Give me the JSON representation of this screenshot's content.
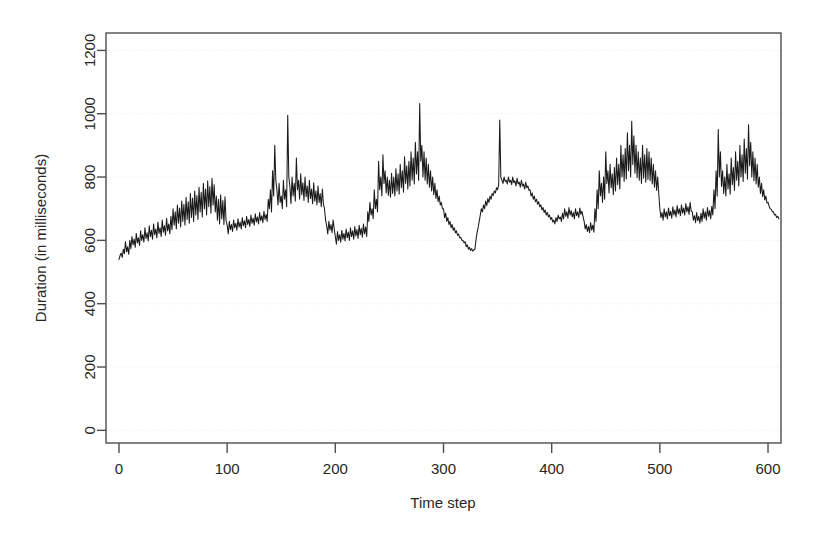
{
  "figure": {
    "kind": "time-series-plot",
    "background_color": "#ffffff",
    "line_color": "#1a1a1a",
    "grid_color": "#e9e9e9",
    "axis_color": "#4d4d4d"
  },
  "chart_data": {
    "type": "line",
    "title": "",
    "subtitle": "",
    "xlabel": "Time step",
    "ylabel": "Duration (in milliseconds)",
    "xlim": [
      -12,
      612
    ],
    "ylim": [
      -40,
      1255
    ],
    "xticks": [
      0,
      100,
      200,
      300,
      400,
      500,
      600
    ],
    "xtick_labels": [
      "0",
      "100",
      "200",
      "300",
      "400",
      "500",
      "600"
    ],
    "yticks": [
      0,
      200,
      400,
      600,
      800,
      1000,
      1200
    ],
    "ytick_labels": [
      "0",
      "200",
      "400",
      "600",
      "800",
      "1000",
      "1200"
    ],
    "grid": true,
    "grid_axis": "y",
    "grid_style": "dotted",
    "legend": null,
    "annotations": [],
    "series": [
      {
        "name": "Duration",
        "x_start": 0,
        "x_step": 1,
        "n_points": 601,
        "y_min_observed": 535,
        "y_max_observed": 1032,
        "values": [
          540,
          552,
          560,
          546,
          572,
          558,
          596,
          564,
          580,
          556,
          600,
          574,
          612,
          586,
          604,
          578,
          622,
          592,
          608,
          584,
          630,
          600,
          618,
          594,
          640,
          606,
          624,
          598,
          646,
          612,
          632,
          604,
          652,
          618,
          636,
          608,
          658,
          622,
          640,
          612,
          664,
          626,
          646,
          616,
          670,
          630,
          652,
          620,
          676,
          634,
          700,
          648,
          690,
          636,
          712,
          654,
          702,
          642,
          724,
          660,
          714,
          648,
          736,
          666,
          722,
          654,
          748,
          672,
          734,
          660,
          756,
          680,
          742,
          666,
          768,
          690,
          752,
          674,
          780,
          700,
          762,
          680,
          788,
          706,
          770,
          686,
          796,
          712,
          776,
          690,
          740,
          664,
          730,
          652,
          744,
          668,
          726,
          650,
          738,
          662,
          648,
          620,
          660,
          634,
          650,
          628,
          664,
          640,
          654,
          632,
          668,
          642,
          658,
          636,
          672,
          646,
          662,
          640,
          676,
          650,
          666,
          644,
          680,
          654,
          670,
          648,
          684,
          658,
          674,
          652,
          688,
          662,
          678,
          656,
          692,
          666,
          682,
          660,
          730,
          700,
          760,
          690,
          820,
          740,
          900,
          790,
          760,
          712,
          780,
          720,
          740,
          700,
          790,
          730,
          760,
          706,
          995,
          800,
          770,
          716,
          800,
          740,
          780,
          724,
          860,
          760,
          790,
          730,
          810,
          744,
          782,
          726,
          800,
          738,
          772,
          720,
          790,
          732,
          762,
          716,
          782,
          724,
          756,
          712,
          772,
          720,
          748,
          706,
          762,
          714,
          700,
          664,
          646,
          620,
          660,
          632,
          650,
          624,
          664,
          636,
          612,
          588,
          628,
          600,
          618,
          594,
          632,
          604,
          622,
          598,
          636,
          608,
          626,
          600,
          640,
          612,
          630,
          604,
          644,
          614,
          634,
          606,
          648,
          618,
          638,
          610,
          652,
          620,
          642,
          612,
          690,
          660,
          720,
          680,
          700,
          668,
          760,
          700,
          730,
          690,
          850,
          760,
          800,
          740,
          870,
          780,
          820,
          750,
          800,
          742,
          790,
          736,
          812,
          748,
          800,
          740,
          826,
          756,
          810,
          746,
          840,
          766,
          820,
          752,
          864,
          780,
          836,
          762,
          850,
          772,
          880,
          790,
          860,
          778,
          910,
          810,
          880,
          790,
          1032,
          850,
          900,
          800,
          880,
          790,
          860,
          778,
          840,
          768,
          820,
          756,
          800,
          744,
          780,
          732,
          760,
          722,
          740,
          712,
          720,
          700,
          700,
          672,
          686,
          660,
          672,
          650,
          660,
          640,
          650,
          632,
          640,
          624,
          630,
          616,
          620,
          608,
          610,
          600,
          600,
          592,
          596,
          580,
          586,
          572,
          578,
          568,
          574,
          566,
          570,
          572,
          600,
          624,
          640,
          660,
          680,
          700,
          690,
          712,
          700,
          724,
          710,
          732,
          720,
          740,
          730,
          748,
          742,
          756,
          750,
          766,
          760,
          776,
          980,
          800,
          790,
          780,
          800,
          786,
          790,
          778,
          800,
          784,
          790,
          776,
          800,
          782,
          788,
          772,
          796,
          778,
          784,
          768,
          790,
          772,
          778,
          762,
          784,
          766,
          772,
          758,
          760,
          740,
          750,
          730,
          740,
          722,
          730,
          714,
          722,
          706,
          712,
          696,
          704,
          688,
          696,
          680,
          688,
          674,
          680,
          666,
          672,
          658,
          664,
          652,
          672,
          660,
          680,
          668,
          674,
          660,
          686,
          668,
          700,
          676,
          690,
          670,
          704,
          680,
          694,
          674,
          688,
          668,
          700,
          678,
          690,
          672,
          702,
          682,
          692,
          676,
          660,
          636,
          650,
          628,
          644,
          624,
          656,
          632,
          648,
          626,
          700,
          660,
          760,
          700,
          820,
          740,
          780,
          720,
          800,
          730,
          880,
          780,
          820,
          750,
          840,
          766,
          810,
          744,
          830,
          756,
          860,
          776,
          840,
          762,
          900,
          800,
          870,
          786,
          890,
          794,
          940,
          820,
          900,
          800,
          976,
          840,
          930,
          812,
          900,
          798,
          880,
          790,
          860,
          780,
          900,
          796,
          870,
          784,
          890,
          792,
          880,
          788,
          860,
          778,
          840,
          768,
          820,
          758,
          800,
          748,
          700,
          672,
          688,
          664,
          700,
          674,
          690,
          668,
          702,
          678,
          692,
          670,
          706,
          680,
          696,
          674,
          710,
          684,
          700,
          678,
          712,
          686,
          702,
          680,
          716,
          690,
          706,
          682,
          720,
          692,
          690,
          664,
          678,
          656,
          688,
          662,
          676,
          654,
          686,
          660,
          700,
          670,
          690,
          664,
          704,
          676,
          694,
          668,
          708,
          680,
          760,
          700,
          820,
          740,
          950,
          800,
          880,
          770,
          820,
          748,
          800,
          740,
          840,
          762,
          810,
          746,
          860,
          776,
          830,
          758,
          880,
          790,
          850,
          772,
          900,
          800,
          870,
          786,
          920,
          812,
          890,
          794,
          965,
          836,
          910,
          800,
          880,
          788,
          860,
          778,
          840,
          768,
          800,
          748,
          780,
          738,
          760,
          728,
          740,
          718,
          720,
          708,
          700,
          698,
          690,
          690,
          680,
          682,
          672,
          676,
          668
        ]
      }
    ]
  }
}
